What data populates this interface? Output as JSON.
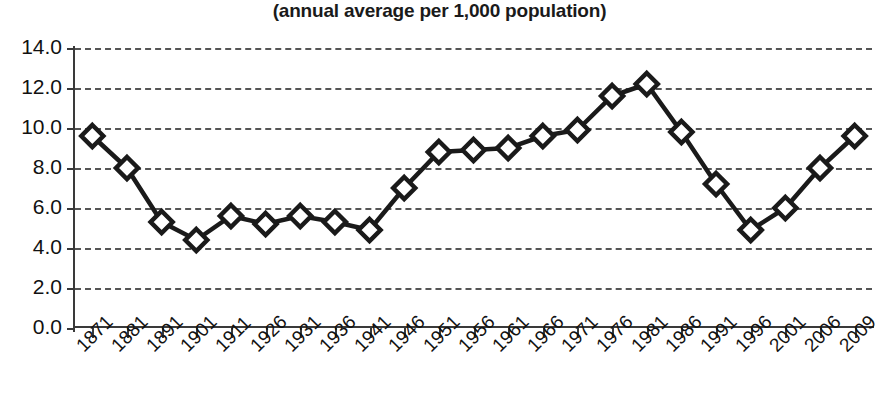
{
  "chart_data": {
    "type": "line",
    "title": "(annual average per 1,000 population)",
    "xlabel": "",
    "ylabel": "",
    "ylim": [
      0.0,
      14.0
    ],
    "ytick_step": 2.0,
    "ytick_labels": [
      "14.0",
      "12.0",
      "10.0",
      "8.0",
      "6.0",
      "4.0",
      "2.0",
      "0.0"
    ],
    "ytick_values": [
      14.0,
      12.0,
      10.0,
      8.0,
      6.0,
      4.0,
      2.0,
      0.0
    ],
    "grid": "horizontal-dashed",
    "legend": "none",
    "marker": "diamond-open",
    "line_color": "#1a1a1a",
    "marker_fill": "#ffffff",
    "categories": [
      "1871",
      "1881",
      "1891",
      "1901",
      "1911",
      "1926",
      "1931",
      "1936",
      "1941",
      "1946",
      "1951",
      "1956",
      "1961",
      "1966",
      "1971",
      "1976",
      "1981",
      "1986",
      "1991",
      "1996",
      "2001",
      "2006",
      "2009"
    ],
    "values": [
      9.6,
      8.0,
      5.3,
      4.4,
      5.6,
      5.2,
      5.6,
      5.3,
      4.9,
      7.0,
      8.8,
      8.9,
      9.0,
      9.6,
      9.9,
      11.6,
      12.2,
      9.8,
      7.2,
      4.9,
      6.0,
      8.0,
      9.6
    ],
    "series": [
      {
        "name": "annual average per 1,000 population",
        "values": [
          9.6,
          8.0,
          5.3,
          4.4,
          5.6,
          5.2,
          5.6,
          5.3,
          4.9,
          7.0,
          8.8,
          8.9,
          9.0,
          9.6,
          9.9,
          11.6,
          12.2,
          9.8,
          7.2,
          4.9,
          6.0,
          8.0,
          9.6
        ]
      }
    ]
  }
}
